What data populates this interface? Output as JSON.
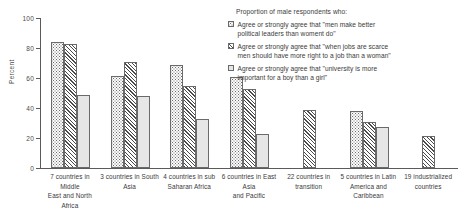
{
  "chart_data": {
    "type": "bar",
    "title": "",
    "xlabel": "",
    "ylabel": "Percent",
    "ylim": [
      0,
      100
    ],
    "yticks": [
      0,
      20,
      40,
      60,
      80,
      100
    ],
    "ytick_labels": [
      "0",
      "20",
      "40",
      "60",
      "80",
      "100"
    ],
    "grid": false,
    "legend_position": "upper right",
    "legend_title": "Proportion of male respondents who:",
    "categories": [
      "7 countries in Middle East and North Africa",
      "3 countries in South Asia",
      "4 countries in sub Saharan Africa",
      "6 countries in East Asia and Pacific",
      "22 countries in transition",
      "5 countries in Latin America and Caribbean",
      "19 industrialized countries"
    ],
    "category_lines": [
      [
        "7 countries in Middle",
        "East and North Africa"
      ],
      [
        "3 countries in South",
        "Asia"
      ],
      [
        "4 countries in sub",
        "Saharan Africa"
      ],
      [
        "6 countries in East Asia",
        "and Pacific"
      ],
      [
        "22 countries in",
        "transition"
      ],
      [
        "5 countries in Latin",
        "America and Caribbean"
      ],
      [
        "19 industrialized",
        "countries"
      ]
    ],
    "series": [
      {
        "name": "Agree or strongly agree that \"men make better political leaders than woment do\"",
        "name_lines": [
          "Agree or strongly agree that \"men make better",
          "political leaders than woment do\""
        ],
        "pattern": "dotted",
        "values": [
          84,
          61.5,
          69,
          60.5,
          null,
          38,
          null
        ]
      },
      {
        "name": "Agree or strongly agree that \"when jobs are scarce men should have more right to a job than a woman\"",
        "name_lines": [
          "Agree or strongly agree that \"when jobs are scarce",
          "men should have more right to a job than a woman\""
        ],
        "pattern": "diagonal-hatch",
        "values": [
          82.5,
          71,
          55,
          53,
          39,
          31,
          21.5
        ]
      },
      {
        "name": "Agree or strongly agree that \"university is more important for a boy than a girl\"",
        "name_lines": [
          "Agree or strongly agree that \"university is more",
          "important for a boy than a girl\""
        ],
        "pattern": "light-solid",
        "values": [
          49,
          48,
          33,
          23,
          null,
          27.5,
          null
        ]
      }
    ],
    "colors": {
      "axis": "#5a5a5a",
      "bar_outline": "#6a6a6a",
      "dotted_fill": "#fbfbfb",
      "hatch_fill": "#4a4a4a",
      "solid_fill": "#e6e6e6",
      "text": "#3a3a3a"
    }
  }
}
